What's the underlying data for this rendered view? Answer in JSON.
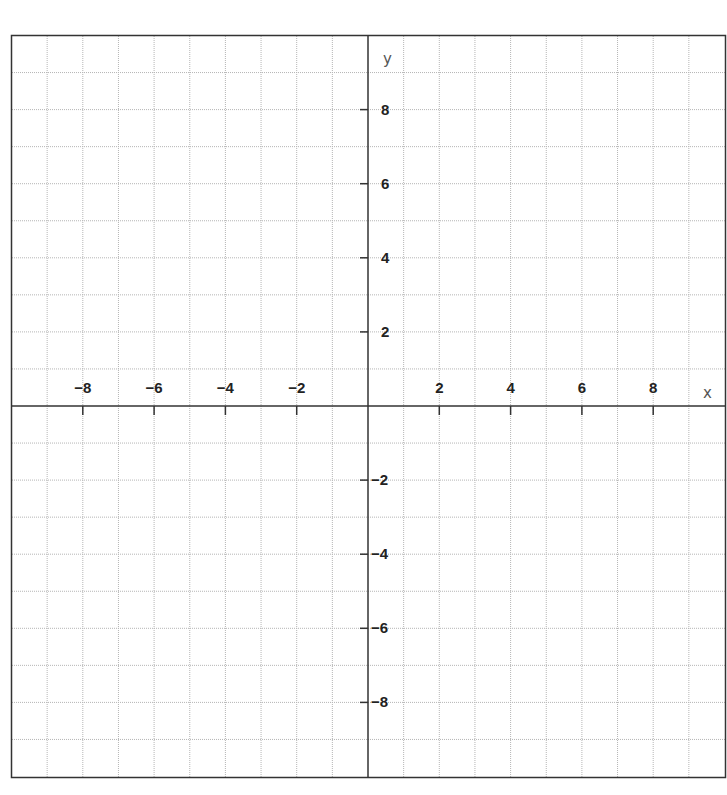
{
  "chart_data": {
    "type": "scatter",
    "title": "",
    "xlabel": "x",
    "ylabel": "y",
    "xlim": [
      -10,
      10
    ],
    "ylim": [
      -10,
      10
    ],
    "grid": true,
    "grid_step": 1,
    "x_ticks": [
      -8,
      -6,
      -4,
      -2,
      2,
      4,
      6,
      8
    ],
    "x_tick_labels": [
      "−8",
      "−6",
      "−4",
      "−2",
      "2",
      "4",
      "6",
      "8"
    ],
    "y_ticks": [
      8,
      6,
      4,
      2,
      -2,
      -4,
      -6,
      -8
    ],
    "y_tick_labels": [
      "8",
      "6",
      "4",
      "2",
      "−2",
      "−4",
      "−6",
      "−8"
    ],
    "series": [],
    "colors": {
      "axis": "#333333",
      "grid": "#b5b5b5",
      "frame": "#333333",
      "background": "#ffffff"
    }
  },
  "axes": {
    "x_label": "x",
    "y_label": "y"
  }
}
